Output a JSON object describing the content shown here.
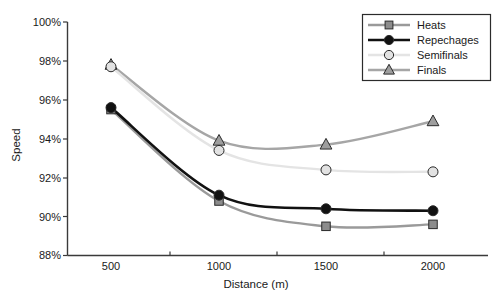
{
  "chart_data": {
    "type": "line",
    "title": "",
    "xlabel": "Distance (m)",
    "ylabel": "Speed",
    "categories": [
      "500",
      "1000",
      "1500",
      "2000"
    ],
    "x": [
      500,
      1000,
      1500,
      2000
    ],
    "xlim": [
      250,
      2250
    ],
    "ylim": [
      88,
      100
    ],
    "y_tick_labels": [
      "88%",
      "90%",
      "92%",
      "94%",
      "96%",
      "98%",
      "100%"
    ],
    "y_ticks": [
      88,
      90,
      92,
      94,
      96,
      98,
      100
    ],
    "grid": false,
    "legend_position": "top-right",
    "series": [
      {
        "name": "Heats",
        "marker": "square",
        "color": "#8c8c8c",
        "line_color": "#9a9a9a",
        "values": [
          95.5,
          90.8,
          89.5,
          89.6
        ]
      },
      {
        "name": "Repechages",
        "marker": "circle",
        "color": "#111111",
        "line_color": "#111111",
        "values": [
          95.6,
          91.1,
          90.4,
          90.3
        ]
      },
      {
        "name": "Semifinals",
        "marker": "circle",
        "color": "#e2e2e2",
        "line_color": "#e4e4e4",
        "values": [
          97.7,
          93.4,
          92.4,
          92.3
        ]
      },
      {
        "name": "Finals",
        "marker": "triangle",
        "color": "#9e9e9e",
        "line_color": "#a6a6a6",
        "values": [
          97.8,
          93.9,
          93.7,
          94.9
        ]
      }
    ]
  },
  "axis": {
    "y_label_0": "88%",
    "y_label_1": "90%",
    "y_label_2": "92%",
    "y_label_3": "94%",
    "y_label_4": "96%",
    "y_label_5": "98%",
    "y_label_6": "100%",
    "x_label_0": "500",
    "x_label_1": "1000",
    "x_label_2": "1500",
    "x_label_3": "2000",
    "x_title": "Distance (m)",
    "y_title": "Speed"
  },
  "legend": {
    "items": [
      {
        "label": "Heats"
      },
      {
        "label": "Repechages"
      },
      {
        "label": "Semifinals"
      },
      {
        "label": "Finals"
      }
    ]
  }
}
